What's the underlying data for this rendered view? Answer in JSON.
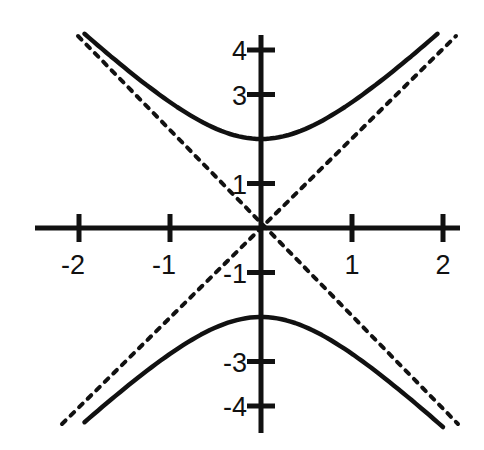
{
  "chart_data": {
    "type": "line",
    "title": "",
    "xlabel": "",
    "ylabel": "",
    "equation": "y^2/4 - x^2 = 1",
    "xlim": [
      -2.5,
      2.2
    ],
    "ylim": [
      -4.5,
      4.5
    ],
    "grid": false,
    "legend": null,
    "x_ticks": [
      {
        "value": -2,
        "label": "-2"
      },
      {
        "value": -1,
        "label": "-1"
      },
      {
        "value": 1,
        "label": "1"
      },
      {
        "value": 2,
        "label": "2"
      }
    ],
    "y_ticks": [
      {
        "value": 4,
        "label": "4"
      },
      {
        "value": 3,
        "label": "3"
      },
      {
        "value": 1,
        "label": "1"
      },
      {
        "value": -1,
        "label": "-1"
      },
      {
        "value": -3,
        "label": "-3"
      },
      {
        "value": -4,
        "label": "-4"
      }
    ],
    "series": [
      {
        "name": "hyperbola-upper-branch",
        "style": "solid",
        "x": [
          -2.0,
          -1.5,
          -1.0,
          -0.5,
          0.0,
          0.5,
          1.0,
          1.5,
          2.0
        ],
        "y": [
          4.47,
          3.61,
          2.83,
          2.24,
          2.0,
          2.24,
          2.83,
          3.61,
          4.47
        ]
      },
      {
        "name": "hyperbola-lower-branch",
        "style": "solid",
        "x": [
          -2.0,
          -1.5,
          -1.0,
          -0.5,
          0.0,
          0.5,
          1.0,
          1.5,
          2.0
        ],
        "y": [
          -4.47,
          -3.61,
          -2.83,
          -2.24,
          -2.0,
          -2.24,
          -2.83,
          -3.61,
          -4.47
        ]
      },
      {
        "name": "asymptote-y-equals-2x",
        "style": "dashed",
        "x": [
          -2.2,
          2.2
        ],
        "y": [
          -4.4,
          4.4
        ]
      },
      {
        "name": "asymptote-y-equals-neg-2x",
        "style": "dashed",
        "x": [
          -2.2,
          2.2
        ],
        "y": [
          4.4,
          -4.4
        ]
      }
    ]
  },
  "colors": {
    "ink": "#111111",
    "background": "#ffffff"
  }
}
